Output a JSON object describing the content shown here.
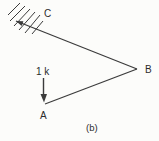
{
  "diagram": {
    "type": "truss-sketch",
    "caption": "(b)",
    "nodes": [
      {
        "id": "A",
        "label": "A"
      },
      {
        "id": "B",
        "label": "B"
      },
      {
        "id": "C",
        "label": "C",
        "support": "fixed-wall-hatched"
      }
    ],
    "members": [
      "C-B",
      "A-B"
    ],
    "load": {
      "at": "A",
      "label": "1 k",
      "direction": "down"
    },
    "colors": {
      "line": "#3b3b3b",
      "text": "#2b2b2b",
      "background": "#fcfcfa"
    }
  }
}
